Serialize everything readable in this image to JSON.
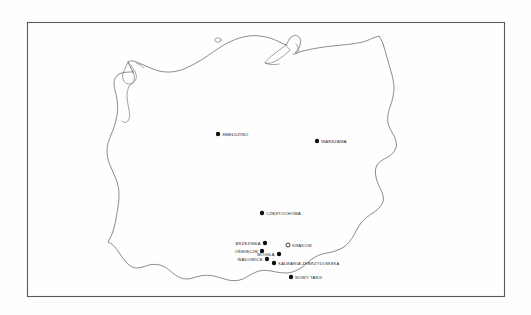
{
  "figure": {
    "kind": "outline-map",
    "region": "Poland",
    "frame": {
      "x": 27,
      "y": 22,
      "width": 478,
      "height": 275
    },
    "background_color": "#fefefe",
    "border_color": "#5a5a5a",
    "coastline_color": "#6e6e6e",
    "marker_filled_color": "#111111",
    "marker_open_color": "#ffffff",
    "label_color": "#1a1a1a"
  },
  "chart_data": {
    "type": "scatter",
    "title": "",
    "xlabel": "",
    "ylabel": "",
    "legend": [],
    "grid": false,
    "points": [
      {
        "label": "SMEŁDZINO",
        "x": 218,
        "y": 134,
        "marker": "filled",
        "label_side": "right"
      },
      {
        "label": "WARSZAWA",
        "x": 317,
        "y": 141,
        "marker": "filled",
        "label_side": "right"
      },
      {
        "label": "CZĘSTOCHOWA",
        "x": 262,
        "y": 213,
        "marker": "filled",
        "label_side": "right"
      },
      {
        "label": "BRZEZINKA",
        "x": 265,
        "y": 243,
        "marker": "filled",
        "label_side": "left"
      },
      {
        "label": "KRAKÓW",
        "x": 288,
        "y": 245,
        "marker": "open",
        "label_side": "right"
      },
      {
        "label": "OŚWIĘCIM",
        "x": 262,
        "y": 251,
        "marker": "filled",
        "label_side": "left"
      },
      {
        "label": "MOGIŁA",
        "x": 279,
        "y": 254,
        "marker": "filled",
        "label_side": "left"
      },
      {
        "label": "WADOWICE",
        "x": 267,
        "y": 259,
        "marker": "filled",
        "label_side": "left"
      },
      {
        "label": "KALWARIA  ZEBRZYDOWSKA",
        "x": 274,
        "y": 263,
        "marker": "filled",
        "label_side": "right"
      },
      {
        "label": "NOWY  TARG",
        "x": 291,
        "y": 277,
        "marker": "filled",
        "label_side": "right"
      }
    ]
  }
}
